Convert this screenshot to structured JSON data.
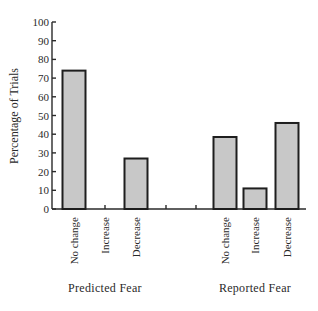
{
  "chart_data": {
    "type": "bar",
    "title": "",
    "xlabel": "",
    "ylabel": "Percentage of Trials",
    "ylim": [
      0,
      100
    ],
    "yticks": [
      0,
      10,
      20,
      30,
      40,
      50,
      60,
      70,
      80,
      90,
      100
    ],
    "grid": false,
    "legend": null,
    "groups": [
      {
        "name": "Predicted Fear",
        "categories": [
          "No change",
          "Increase",
          "Decrease"
        ],
        "values": [
          74,
          0,
          27
        ]
      },
      {
        "name": "Reported Fear",
        "categories": [
          "No change",
          "Increase",
          "Decrease"
        ],
        "values": [
          38.5,
          11,
          46
        ]
      }
    ],
    "bar_fill": "#c8c8c8",
    "bar_stroke": "#1e1e1e"
  }
}
